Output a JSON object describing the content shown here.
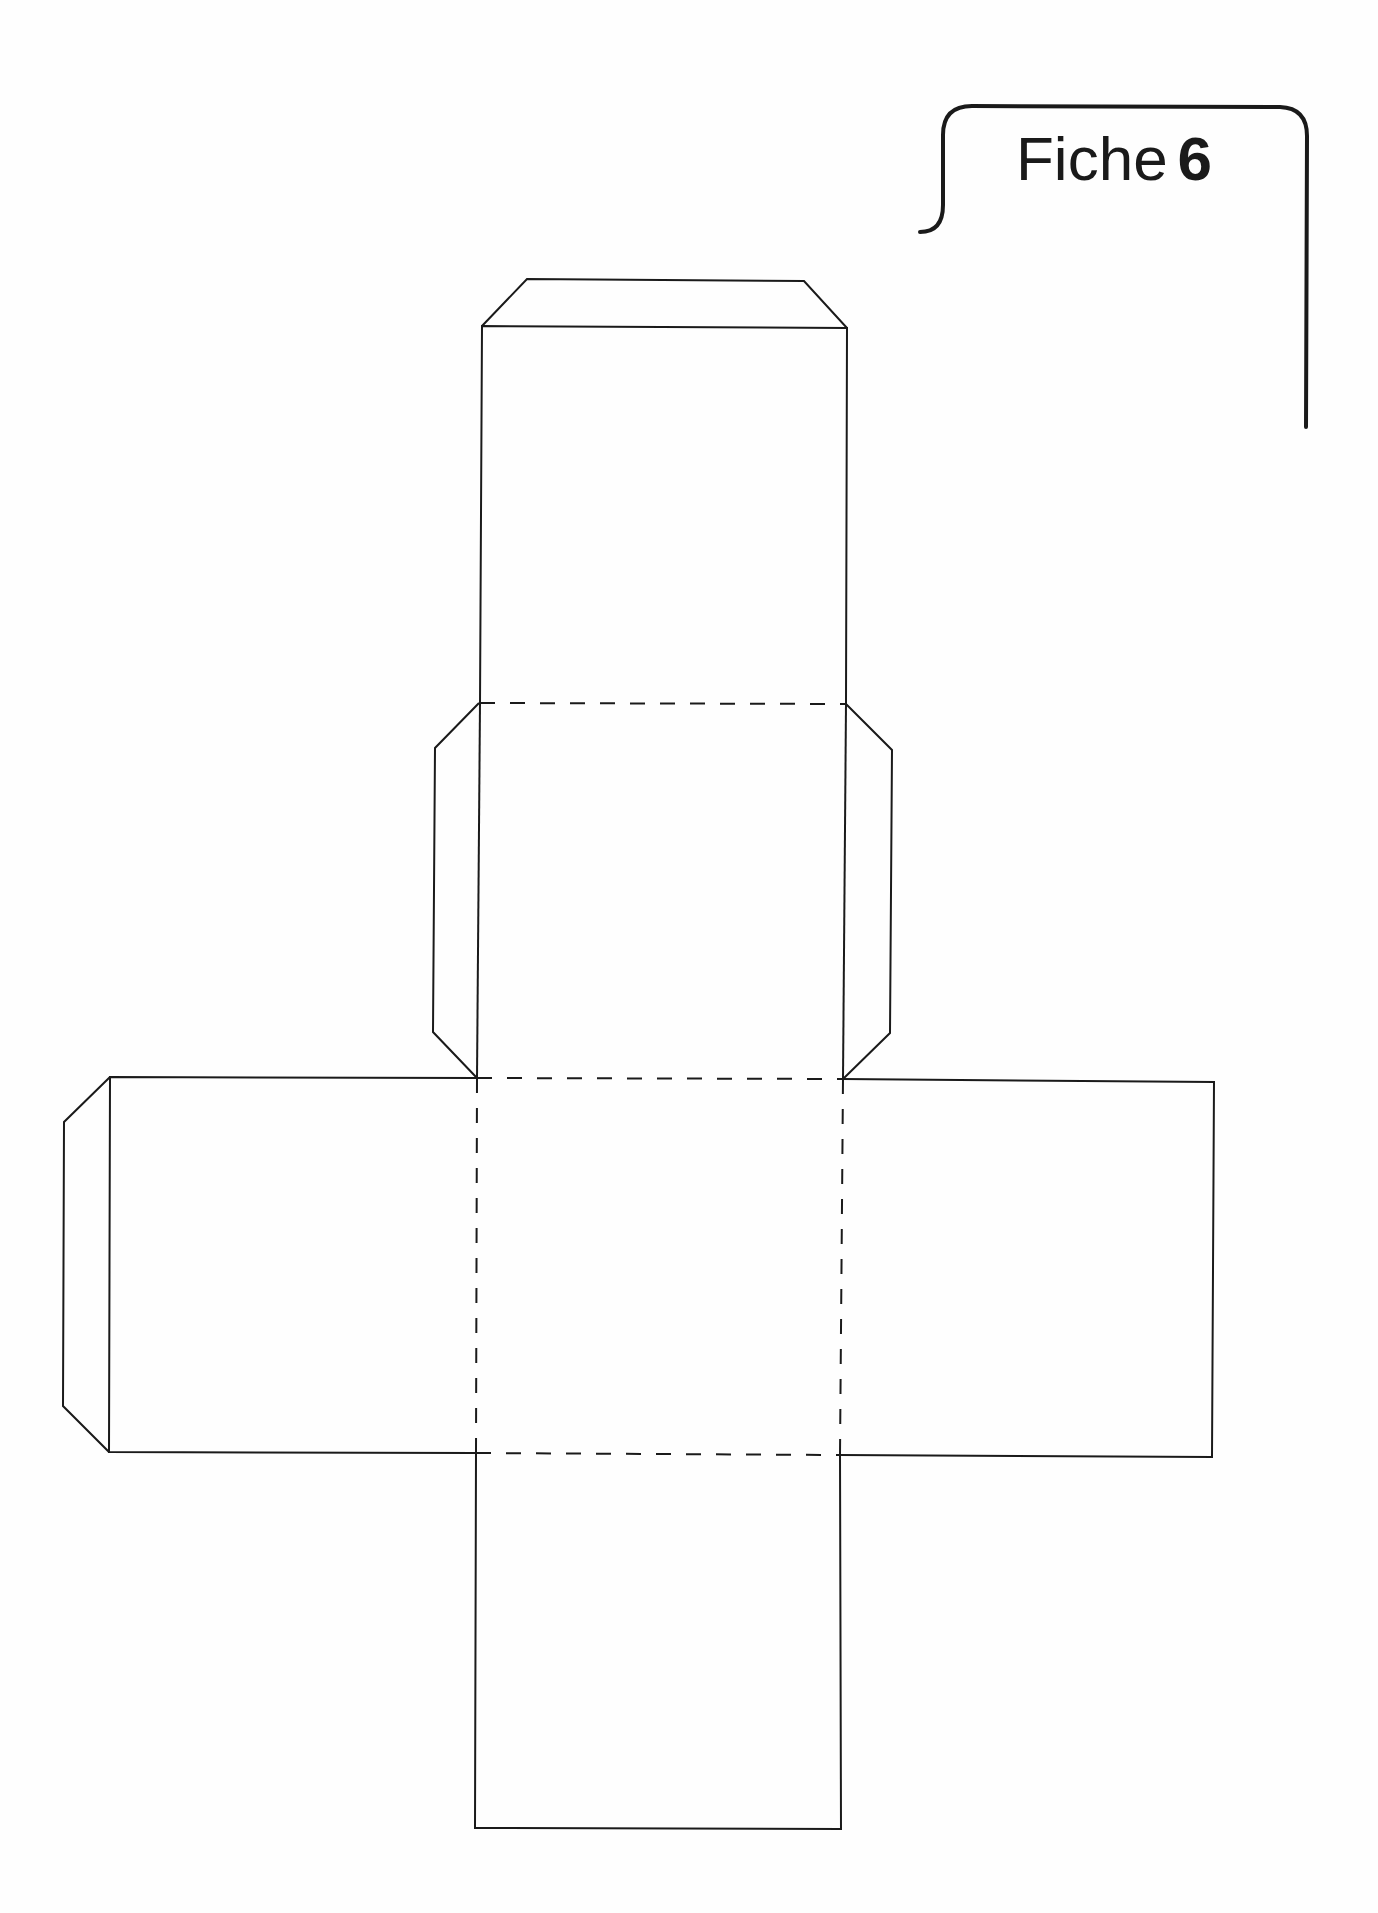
{
  "header": {
    "label_word": "Fiche",
    "label_number": "6"
  },
  "figure": {
    "type": "cube-net",
    "faces": 6,
    "glue_tabs": 4,
    "line_styles": {
      "cut": "solid",
      "fold": "dashed"
    },
    "colors": {
      "line": "#1a1a1a",
      "background": "#fefefe"
    }
  }
}
